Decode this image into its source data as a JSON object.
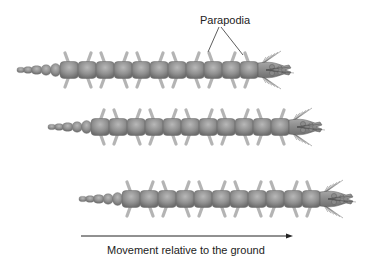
{
  "diagram": {
    "labels": {
      "parapodia": "Parapodia",
      "movement": "Movement relative to the ground"
    },
    "colors": {
      "background": "#ffffff",
      "segment_fill": "#8f8f8f",
      "segment_highlight": "#b4b4b4",
      "segment_shadow": "#6e6e6e",
      "parapodia": "#a9a9a9",
      "text": "#222222",
      "arrow": "#222222"
    },
    "worms": [
      {
        "name": "worm-top",
        "tail_x": 17,
        "body_start_x": 60,
        "head_x": 258,
        "y": 70,
        "segments": 11,
        "phase": 0
      },
      {
        "name": "worm-middle",
        "tail_x": 48,
        "body_start_x": 91,
        "head_x": 289,
        "y": 127,
        "segments": 11,
        "phase": 1
      },
      {
        "name": "worm-bottom",
        "tail_x": 79,
        "body_start_x": 122,
        "head_x": 320,
        "y": 199,
        "segments": 11,
        "phase": 0
      }
    ],
    "arrow": {
      "x1": 81,
      "x2": 293,
      "y": 236,
      "direction": "right"
    }
  }
}
